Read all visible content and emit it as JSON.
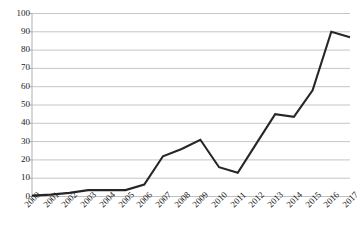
{
  "chart_data": {
    "type": "line",
    "title": "",
    "xlabel": "",
    "ylabel": "",
    "categories": [
      "2000",
      "2001",
      "2002",
      "2003",
      "2004",
      "2005",
      "2006",
      "2007",
      "2008",
      "2009",
      "2010",
      "2011",
      "2012",
      "2013",
      "2014",
      "2015",
      "2016",
      "2017"
    ],
    "values": [
      0.5,
      1,
      2,
      3.5,
      3.5,
      3.5,
      6.5,
      22,
      26,
      31,
      16,
      13,
      29,
      45,
      43.5,
      58,
      90,
      87
    ],
    "series": [
      {
        "name": "series-1",
        "values": [
          0.5,
          1,
          2,
          3.5,
          3.5,
          3.5,
          6.5,
          22,
          26,
          31,
          16,
          13,
          29,
          45,
          43.5,
          58,
          90,
          87
        ]
      }
    ],
    "ylim": [
      0,
      100
    ],
    "yticks": [
      0,
      10,
      20,
      30,
      40,
      50,
      60,
      70,
      80,
      90,
      100
    ],
    "ytick_labels": [
      "0",
      "10",
      "20",
      "30",
      "40",
      "50",
      "60",
      "70",
      "80",
      "90",
      "100"
    ],
    "xtick_labels": [
      "2000",
      "2001",
      "2002",
      "2003",
      "2004",
      "2005",
      "2006",
      "2007",
      "2008",
      "2009",
      "2010",
      "2011",
      "2012",
      "2013",
      "2014",
      "2015",
      "2016",
      "2017"
    ],
    "grid": true,
    "grid_axis": "y",
    "legend": false,
    "legend_position": "none",
    "annotations": [],
    "colors": {
      "line": "#262626",
      "grid": "#bfbfbf",
      "axis": "#a6a6a6",
      "background": "#ffffff",
      "text": "#1a1a1a"
    },
    "xtick_rotation": -45
  }
}
